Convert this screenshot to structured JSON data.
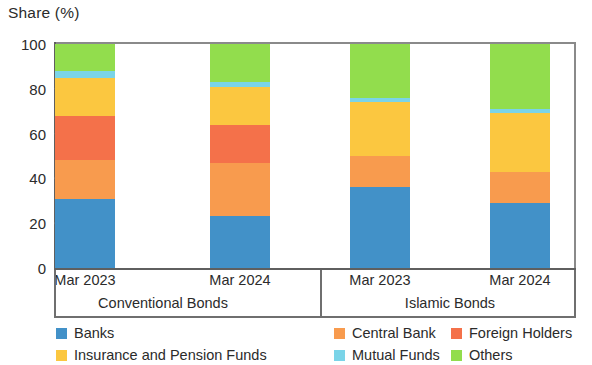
{
  "chart_data": {
    "type": "bar",
    "subtype": "stacked-bar-100",
    "title": "Share (%)",
    "xlabel": "",
    "ylabel": "Share (%)",
    "ylim": [
      0,
      100
    ],
    "yticks": [
      0,
      20,
      40,
      60,
      80,
      100
    ],
    "grid": false,
    "legend_position": "bottom",
    "categories": [
      "Mar 2023",
      "Mar 2024",
      "Mar 2023",
      "Mar 2024"
    ],
    "groups": [
      {
        "label": "Conventional Bonds",
        "categories": [
          "Mar 2023",
          "Mar 2024"
        ]
      },
      {
        "label": "Islamic Bonds",
        "categories": [
          "Mar 2023",
          "Mar 2024"
        ]
      }
    ],
    "series": [
      {
        "name": "Banks",
        "color": "#4291c8",
        "values": [
          31,
          23,
          36,
          29
        ]
      },
      {
        "name": "Central Bank",
        "color": "#f89b4e",
        "values": [
          17,
          24,
          14,
          14
        ]
      },
      {
        "name": "Foreign Holders",
        "color": "#f4714a",
        "values": [
          20,
          17,
          0,
          0
        ]
      },
      {
        "name": "Insurance and Pension Funds",
        "color": "#fbc740",
        "values": [
          17,
          17,
          24,
          26
        ]
      },
      {
        "name": "Mutual Funds",
        "color": "#7ad4e8",
        "values": [
          3,
          2,
          2,
          2
        ]
      },
      {
        "name": "Others",
        "color": "#92dd4d",
        "values": [
          12,
          17,
          24,
          29
        ]
      }
    ],
    "legend_entries": [
      {
        "label": "Banks",
        "color": "#4291c8"
      },
      {
        "label": "Central Bank",
        "color": "#f89b4e"
      },
      {
        "label": "Foreign Holders",
        "color": "#f4714a"
      },
      {
        "label": "Insurance and Pension Funds",
        "color": "#fbc740"
      },
      {
        "label": "Mutual Funds",
        "color": "#7ad4e8"
      },
      {
        "label": "Others",
        "color": "#92dd4d"
      }
    ]
  }
}
